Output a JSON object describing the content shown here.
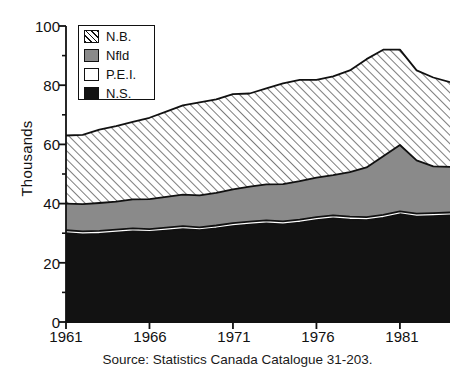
{
  "chart_data": {
    "type": "area",
    "title": "",
    "subtitle": "",
    "xlabel": "",
    "ylabel": "Thousands",
    "stacked": true,
    "grid": false,
    "legend_position": "top-left",
    "xlim": [
      1961,
      1984
    ],
    "ylim": [
      0,
      100
    ],
    "y_ticks": [
      0,
      20,
      40,
      60,
      80,
      100
    ],
    "y_minor_ticks": [
      10,
      30,
      50,
      70,
      90
    ],
    "x_ticks": [
      1961,
      1966,
      1971,
      1976,
      1981
    ],
    "x_tick_labels": [
      "1961",
      "1966",
      "1971",
      "1976",
      "1981"
    ],
    "x": [
      1961,
      1962,
      1963,
      1964,
      1965,
      1966,
      1967,
      1968,
      1969,
      1970,
      1971,
      1972,
      1973,
      1974,
      1975,
      1976,
      1977,
      1978,
      1979,
      1980,
      1981,
      1982,
      1983,
      1984
    ],
    "series": [
      {
        "name": "N.S.",
        "fill": "#121212",
        "pattern": "solid-black",
        "order": 1,
        "values": [
          30.0,
          29.6,
          29.8,
          30.2,
          30.6,
          30.4,
          30.9,
          31.4,
          31.0,
          31.6,
          32.4,
          32.9,
          33.3,
          33.0,
          33.6,
          34.4,
          35.0,
          34.6,
          34.4,
          35.2,
          36.4,
          35.6,
          35.8,
          36.0
        ]
      },
      {
        "name": "P.E.I.",
        "fill": "#ffffff",
        "pattern": "solid-white",
        "order": 2,
        "values": [
          1.0,
          1.0,
          1.0,
          1.0,
          1.0,
          1.0,
          1.0,
          1.0,
          1.0,
          1.0,
          1.0,
          1.0,
          1.0,
          1.0,
          1.0,
          1.0,
          1.0,
          1.0,
          1.0,
          1.0,
          1.0,
          1.0,
          1.0,
          1.0
        ]
      },
      {
        "name": "Nfld",
        "fill": "#8a8a8a",
        "pattern": "solid-gray",
        "order": 3,
        "values": [
          9.0,
          9.2,
          9.4,
          9.5,
          9.8,
          10.1,
          10.4,
          10.6,
          10.8,
          11.0,
          11.4,
          11.8,
          12.2,
          12.6,
          13.0,
          13.4,
          13.6,
          15.0,
          16.8,
          19.8,
          22.4,
          18.0,
          15.8,
          15.4
        ]
      },
      {
        "name": "N.B.",
        "fill": "#ffffff",
        "pattern": "diagonal-hatch",
        "order": 4,
        "values": [
          23.0,
          23.4,
          24.8,
          25.5,
          26.2,
          27.5,
          28.8,
          30.2,
          31.4,
          31.6,
          32.2,
          31.5,
          32.4,
          34.0,
          34.2,
          33.0,
          33.4,
          34.4,
          36.6,
          36.0,
          32.2,
          30.4,
          30.0,
          28.6
        ]
      }
    ],
    "stacked_tops": {
      "N.S.": [
        30.0,
        29.6,
        29.8,
        30.2,
        30.6,
        30.4,
        30.9,
        31.4,
        31.0,
        31.6,
        32.4,
        32.9,
        33.3,
        33.0,
        33.6,
        34.4,
        35.0,
        34.6,
        34.4,
        35.2,
        36.4,
        35.6,
        35.8,
        36.0
      ],
      "P.E.I.": [
        31.0,
        30.6,
        30.8,
        31.2,
        31.6,
        31.4,
        31.9,
        32.4,
        32.0,
        32.6,
        33.4,
        33.9,
        34.3,
        34.0,
        34.6,
        35.4,
        36.0,
        35.6,
        35.4,
        36.2,
        37.4,
        36.6,
        36.8,
        37.0
      ],
      "Nfld": [
        40.0,
        39.8,
        40.2,
        40.7,
        41.4,
        41.5,
        42.3,
        43.0,
        42.8,
        43.6,
        44.8,
        45.7,
        46.5,
        46.6,
        47.6,
        48.8,
        49.6,
        50.6,
        52.2,
        56.0,
        59.8,
        54.6,
        52.6,
        52.4
      ],
      "N.B.": [
        63.0,
        63.2,
        65.0,
        66.2,
        67.6,
        69.0,
        71.1,
        73.2,
        74.2,
        75.2,
        77.0,
        77.2,
        78.9,
        80.6,
        81.8,
        81.8,
        83.0,
        85.0,
        88.8,
        92.0,
        92.0,
        85.0,
        82.6,
        81.0
      ]
    },
    "source_note": "Source: Statistics Canada Catalogue 31-203."
  },
  "legend": {
    "items": [
      {
        "label": "N.B.",
        "swatch": "hatch"
      },
      {
        "label": "Nfld",
        "swatch": "gray"
      },
      {
        "label": "P.E.I.",
        "swatch": "white"
      },
      {
        "label": "N.S.",
        "swatch": "black"
      }
    ]
  },
  "axes": {
    "y_label": "Thousands",
    "y_tick_labels": [
      "100",
      "80",
      "60",
      "40",
      "20",
      "0"
    ],
    "x_tick_labels": [
      "1961",
      "1966",
      "1971",
      "1976",
      "1981"
    ]
  },
  "footer": {
    "source": "Source: Statistics Canada Catalogue 31-203."
  },
  "colors": {
    "axis": "#111111",
    "nfld_gray": "#8a8a8a",
    "ns_black": "#121212",
    "pei_white": "#ffffff",
    "background": "#ffffff"
  }
}
